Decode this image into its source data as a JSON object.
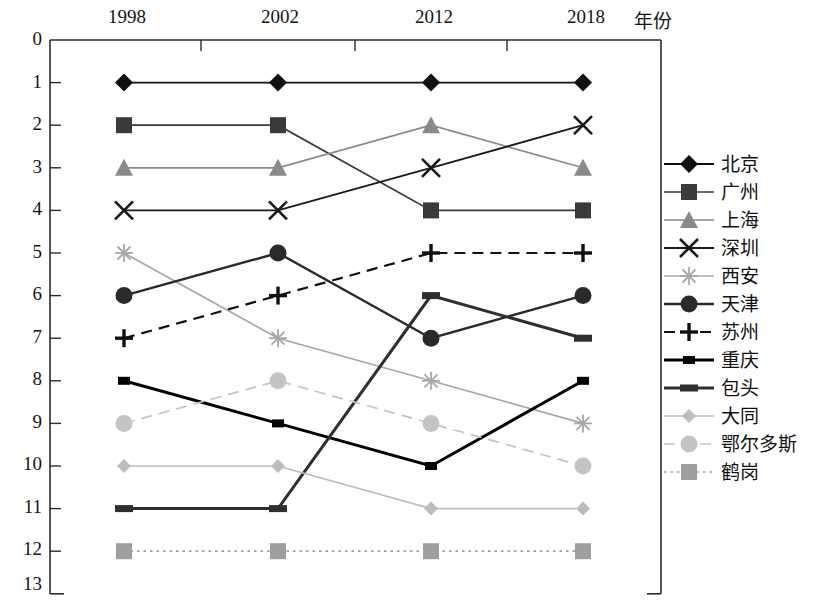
{
  "chart_data": {
    "type": "line",
    "title": "",
    "xlabel": "年份",
    "ylabel": "",
    "categories": [
      "1998",
      "2002",
      "2012",
      "2018"
    ],
    "x_tick_labels": [
      "1998",
      "2002",
      "2012",
      "2018"
    ],
    "y_tick_labels": [
      "0",
      "1",
      "2",
      "3",
      "4",
      "5",
      "6",
      "7",
      "8",
      "9",
      "10",
      "11",
      "12",
      "13"
    ],
    "ylim": [
      0,
      13
    ],
    "y_inverted": true,
    "grid": false,
    "legend_position": "right",
    "series": [
      {
        "name": "北京",
        "values": [
          1,
          1,
          1,
          1
        ],
        "marker": "diamond",
        "color": "#101010",
        "line": "solid"
      },
      {
        "name": "广州",
        "values": [
          2,
          2,
          4,
          4
        ],
        "marker": "square",
        "color": "#3a3a3a",
        "line": "solid"
      },
      {
        "name": "上海",
        "values": [
          3,
          3,
          2,
          3
        ],
        "marker": "triangle",
        "color": "#8a8a8a",
        "line": "solid"
      },
      {
        "name": "深圳",
        "values": [
          4,
          4,
          3,
          2
        ],
        "marker": "cross-x",
        "color": "#1a1a1a",
        "line": "solid"
      },
      {
        "name": "西安",
        "values": [
          5,
          7,
          8,
          9
        ],
        "marker": "asterisk",
        "color": "#a8a8a8",
        "line": "solid"
      },
      {
        "name": "天津",
        "values": [
          6,
          5,
          7,
          6
        ],
        "marker": "circle",
        "color": "#2a2a2a",
        "line": "solid"
      },
      {
        "name": "苏州",
        "values": [
          7,
          6,
          5,
          5
        ],
        "marker": "plus",
        "color": "#111111",
        "line": "dashed"
      },
      {
        "name": "重庆",
        "values": [
          8,
          9,
          10,
          8
        ],
        "marker": "small-square",
        "color": "#000000",
        "line": "solid"
      },
      {
        "name": "包头",
        "values": [
          11,
          11,
          6,
          7
        ],
        "marker": "bar",
        "color": "#2f2f2f",
        "line": "solid"
      },
      {
        "name": "大同",
        "values": [
          10,
          10,
          11,
          11
        ],
        "marker": "small-diamond",
        "color": "#bdbdbd",
        "line": "solid"
      },
      {
        "name": "鄂尔多斯",
        "values": [
          9,
          8,
          9,
          10
        ],
        "marker": "circle-light",
        "color": "#c4c4c4",
        "line": "dashed"
      },
      {
        "name": "鹤岗",
        "values": [
          12,
          12,
          12,
          12
        ],
        "marker": "square-light",
        "color": "#9e9e9e",
        "line": "dotted"
      }
    ]
  },
  "legend": {
    "items": [
      {
        "label": "北京"
      },
      {
        "label": "广州"
      },
      {
        "label": "上海"
      },
      {
        "label": "深圳"
      },
      {
        "label": "西安"
      },
      {
        "label": "天津"
      },
      {
        "label": "苏州"
      },
      {
        "label": "重庆"
      },
      {
        "label": "包头"
      },
      {
        "label": "大同"
      },
      {
        "label": "鄂尔多斯"
      },
      {
        "label": "鹤岗"
      }
    ]
  }
}
